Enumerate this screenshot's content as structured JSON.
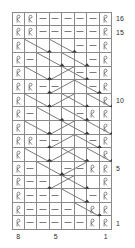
{
  "chart": {
    "type": "knitting-chart",
    "columns": 8,
    "rows": 16,
    "cell_width": 12.5,
    "cell_height": 13.625,
    "grid_color": "#8a8a8a",
    "symbol_color": "#6b6b6b",
    "label_color": "#2b2b2b",
    "background": "#ffffff",
    "legend": {
      "knit_symbol": "R",
      "purl_symbol": "–",
      "note": "R = twisted knit stitch, – = purl stitch, diagonals = travelling stitches"
    },
    "row_labels": [
      {
        "row": 16,
        "text": "16"
      },
      {
        "row": 15,
        "text": "15"
      },
      {
        "row": 10,
        "text": "10"
      },
      {
        "row": 5,
        "text": "5"
      },
      {
        "row": 1,
        "text": "1"
      }
    ],
    "column_labels": [
      {
        "col": 8,
        "text": "8"
      },
      {
        "col": 5,
        "text": "5"
      },
      {
        "col": 1,
        "text": "1"
      }
    ],
    "cells": [
      {
        "row": 16,
        "values": [
          "R",
          "R",
          "-",
          "-",
          "-",
          "-",
          "-",
          "R"
        ]
      },
      {
        "row": 15,
        "values": [
          "R",
          "R",
          "-",
          "-",
          "-",
          "-",
          "-",
          "R"
        ]
      },
      {
        "row": 14,
        "values": [
          "R",
          "t",
          "t",
          "t",
          "t",
          "-",
          "-",
          "R"
        ]
      },
      {
        "row": 13,
        "values": [
          "R",
          "-",
          "t",
          "t",
          "t",
          "t",
          "-",
          "R"
        ]
      },
      {
        "row": 12,
        "values": [
          "R",
          "t",
          "t",
          "t",
          "t",
          "-",
          "-",
          "R"
        ]
      },
      {
        "row": 11,
        "values": [
          "R",
          "R",
          "-",
          "-",
          "t",
          "t",
          "-",
          "R"
        ]
      },
      {
        "row": 10,
        "values": [
          "R",
          "t",
          "t",
          "t",
          "t",
          "t",
          "t",
          "R"
        ]
      },
      {
        "row": 9,
        "values": [
          "R",
          "-",
          "t",
          "t",
          "t",
          "-",
          "R",
          "R"
        ]
      },
      {
        "row": 8,
        "values": [
          "R",
          "t",
          "t",
          "t",
          "t",
          "t",
          "t",
          "R"
        ]
      },
      {
        "row": 7,
        "values": [
          "R",
          "R",
          "-",
          "-",
          "t",
          "t",
          "-",
          "R"
        ]
      },
      {
        "row": 6,
        "values": [
          "R",
          "t",
          "t",
          "t",
          "t",
          "t",
          "t",
          "R"
        ]
      },
      {
        "row": 5,
        "values": [
          "R",
          "-",
          "t",
          "t",
          "-",
          "-",
          "R",
          "R"
        ]
      },
      {
        "row": 4,
        "values": [
          "R",
          "-",
          "-",
          "t",
          "t",
          "t",
          "t",
          "R"
        ]
      },
      {
        "row": 3,
        "values": [
          "R",
          "-",
          "-",
          "-",
          "t",
          "t",
          "-",
          "R"
        ]
      },
      {
        "row": 2,
        "values": [
          "R",
          "-",
          "-",
          "-",
          "-",
          "t",
          "R",
          "R"
        ]
      },
      {
        "row": 1,
        "values": [
          "R",
          "-",
          "-",
          "-",
          "-",
          "-",
          "R",
          "R"
        ]
      }
    ]
  }
}
